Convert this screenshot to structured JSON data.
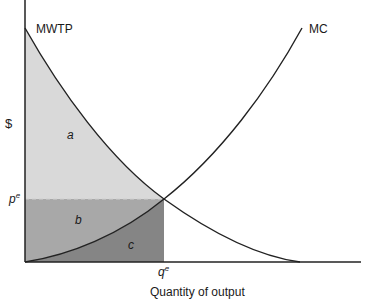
{
  "diagram": {
    "title": "",
    "y_axis_label": "$",
    "x_axis_label": "Quantity of output",
    "curves": [
      {
        "name": "MWTP",
        "label": "MWTP"
      },
      {
        "name": "MC",
        "label": "MC"
      }
    ],
    "equilibrium": {
      "price_label": "p",
      "price_sup": "e",
      "quantity_label": "q",
      "quantity_sup": "e"
    },
    "regions": [
      {
        "id": "a",
        "label": "a",
        "color": "#d9d9d9"
      },
      {
        "id": "b",
        "label": "b",
        "color": "#a8a8a8"
      },
      {
        "id": "c",
        "label": "c",
        "color": "#858585"
      }
    ],
    "colors": {
      "axis": "#222222",
      "curve": "#222222",
      "dashed": "#cfcfcf"
    }
  }
}
